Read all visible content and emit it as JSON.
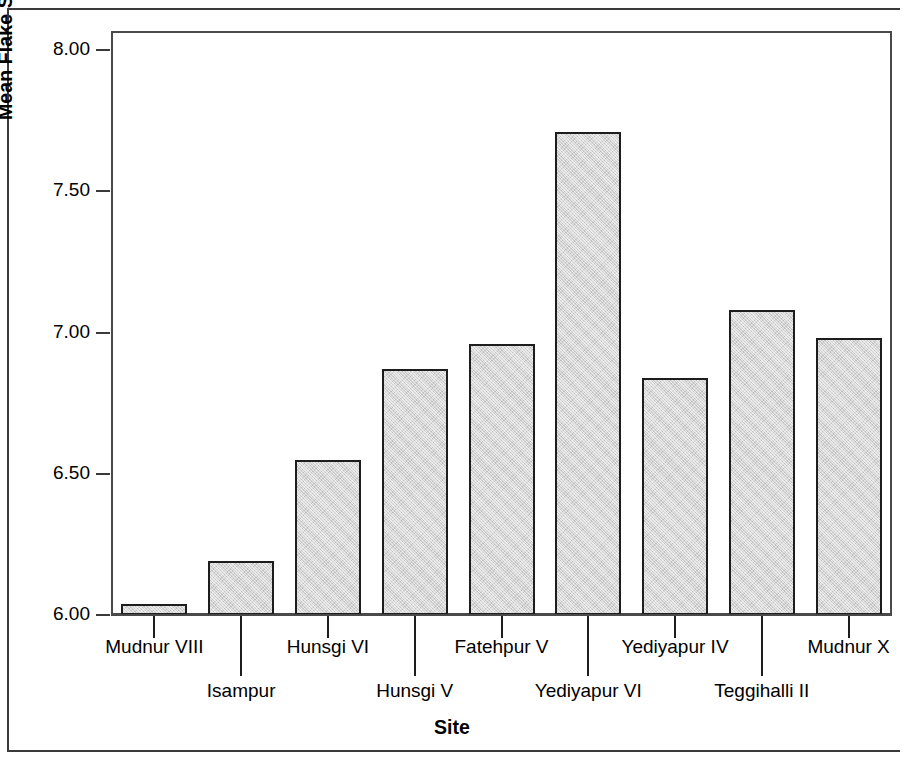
{
  "chart_data": {
    "type": "bar",
    "title": "",
    "xlabel": "Site",
    "ylabel": "Mean Flake Scar Width to Length Ratio",
    "categories": [
      "Mudnur VIII",
      "Isampur",
      "Hunsgi VI",
      "Hunsgi V",
      "Fatehpur V",
      "Yediyapur VI",
      "Yediyapur IV",
      "Teggihalli II",
      "Mudnur X"
    ],
    "values": [
      6.04,
      6.19,
      6.55,
      6.87,
      6.96,
      7.71,
      6.84,
      7.08,
      6.98
    ],
    "ylim": [
      5.92,
      8.07
    ],
    "yticks": [
      6.0,
      6.5,
      7.0,
      7.5,
      8.0
    ],
    "ytick_labels": [
      "6.00",
      "6.50",
      "7.00",
      "7.50",
      "8.00"
    ],
    "grid": false,
    "legend": null,
    "bar_fill_color": "#d4d4d4",
    "bar_edge_color": "#1d1d1d",
    "axis_color": "#4a4a4a",
    "background_color": "#ffffff",
    "label_rows": [
      "top",
      "bottom",
      "top",
      "bottom",
      "top",
      "bottom",
      "top",
      "bottom",
      "top"
    ]
  }
}
